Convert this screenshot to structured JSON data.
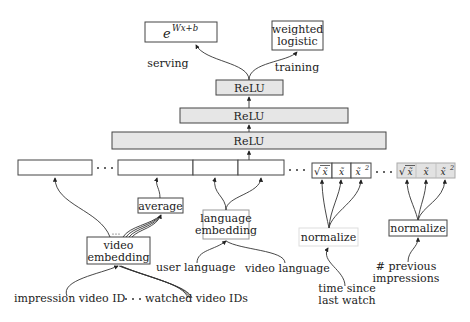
{
  "diagram": {
    "title": "",
    "output_nodes": {
      "serving_function": "e^{Wx+b}",
      "serving_base": "e",
      "serving_exponent": "Wx+b",
      "training_function_line1": "weighted",
      "training_function_line2": "logistic"
    },
    "edge_labels": {
      "serving": "serving",
      "training": "training"
    },
    "layers": [
      {
        "label": "ReLU"
      },
      {
        "label": "ReLU"
      },
      {
        "label": "ReLU"
      }
    ],
    "feature_transforms": {
      "sqrt": "√x̃",
      "x": "x̃",
      "x2": "x̃²",
      "sqrt_tilde": "x̃",
      "x2_base": "x̃",
      "x2_exp": "2"
    },
    "processing_nodes": {
      "average": "average",
      "video_embedding_line1": "video",
      "video_embedding_line2": "embedding",
      "language_embedding_line1": "language",
      "language_embedding_line2": "embedding",
      "normalize_1": "normalize",
      "normalize_2": "normalize"
    },
    "inputs": {
      "impression_video_id": "impression video ID",
      "watched_video_ids": "watched video IDs",
      "ellipsis": "· · ·",
      "user_language": "user language",
      "video_language": "video language",
      "time_since_line1": "time since",
      "time_since_line2": "last watch",
      "prev_impressions_line1": "# previous",
      "prev_impressions_line2": "impressions"
    },
    "colors": {
      "layer_fill": "#e6e6e6",
      "box_stroke": "#444444",
      "background": "#ffffff"
    }
  }
}
